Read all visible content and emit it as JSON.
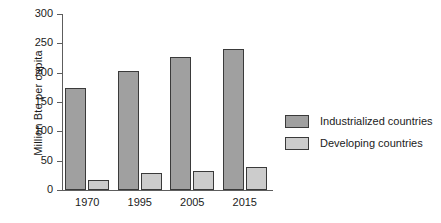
{
  "chart_data": {
    "type": "bar",
    "title": "",
    "subtitle": "",
    "xlabel": "",
    "ylabel": "Million Bte per capita",
    "categories": [
      "1970",
      "1995",
      "2005",
      "2015"
    ],
    "series": [
      {
        "name": "Industrialized countries",
        "color": "#a0a0a0",
        "values": [
          174,
          203,
          226,
          241
        ]
      },
      {
        "name": "Developing countries",
        "color": "#cccccc",
        "values": [
          17,
          29,
          32,
          39
        ]
      }
    ],
    "ylim": [
      0,
      300
    ],
    "yticks": [
      0,
      50,
      100,
      150,
      200,
      250,
      300
    ],
    "ytick_labels": [
      "0",
      "50",
      "100",
      "150",
      "200",
      "250",
      "300"
    ],
    "grid": false,
    "legend_position": "right",
    "axis_color": "#5d5d5d",
    "bar_edge_color": "#3a3a3a",
    "text_color": "#1b1b1b"
  }
}
